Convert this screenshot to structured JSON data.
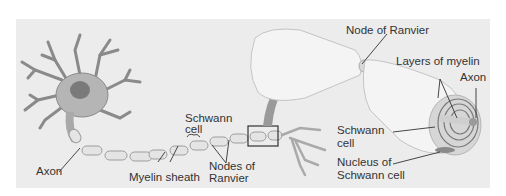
{
  "figure": {
    "colors": {
      "panel_bg": "#ececec",
      "cell_fill": "#bdbdbd",
      "sheath_fill": "#f2f2f2",
      "line": "#444444",
      "arrow": "#9a9a9a"
    }
  },
  "labels": {
    "axon_left": "Axon",
    "myelin_sheath": "Myelin sheath",
    "schwann_cell_1": "Schwann",
    "schwann_cell_2": "cell",
    "nodes_of_ranvier_1": "Nodes of",
    "nodes_of_ranvier_2": "Ranvier",
    "node_of_ranvier": "Node of Ranvier",
    "layers_of_myelin": "Layers of myelin",
    "axon_right": "Axon",
    "schwann_cell_right_1": "Schwann",
    "schwann_cell_right_2": "cell",
    "nucleus_1": "Nucleus of",
    "nucleus_2": "Schwann cell"
  }
}
